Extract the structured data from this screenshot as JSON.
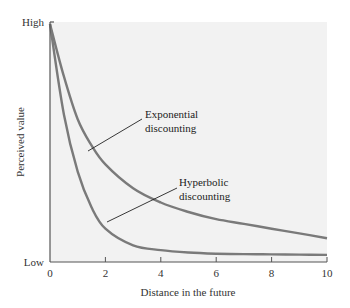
{
  "chart_data": {
    "type": "line",
    "title": "",
    "xlabel": "Distance in the future",
    "ylabel": "Perceived value",
    "xlim": [
      0,
      10
    ],
    "ylim": [
      "Low",
      "High"
    ],
    "x_ticks": [
      "0",
      "2",
      "4",
      "6",
      "8",
      "10"
    ],
    "y_ticks": [
      "Low",
      "High"
    ],
    "grid": false,
    "legend": "none (inline annotations)",
    "series": [
      {
        "name": "Exponential discounting",
        "x": [
          0,
          0.5,
          1,
          1.5,
          2,
          3,
          4,
          5,
          6,
          7,
          8,
          9,
          10
        ],
        "values": [
          1.0,
          0.78,
          0.6,
          0.49,
          0.41,
          0.31,
          0.25,
          0.21,
          0.18,
          0.16,
          0.14,
          0.12,
          0.1
        ]
      },
      {
        "name": "Hyperbolic discounting",
        "x": [
          0,
          0.5,
          1,
          1.5,
          2,
          3,
          4,
          5,
          6,
          7,
          8,
          9,
          10
        ],
        "values": [
          1.0,
          0.62,
          0.38,
          0.23,
          0.14,
          0.07,
          0.05,
          0.04,
          0.035,
          0.033,
          0.032,
          0.031,
          0.03
        ]
      }
    ],
    "annotations": [
      {
        "text": [
          "Exponential",
          "discounting"
        ],
        "points_to": "Exponential discounting"
      },
      {
        "text": [
          "Hyperbolic",
          "discounting"
        ],
        "points_to": "Hyperbolic discounting"
      }
    ],
    "colors": {
      "plot_background": "#f2f2f2",
      "curve": "#7a7a7a",
      "axis": "#555555"
    }
  }
}
